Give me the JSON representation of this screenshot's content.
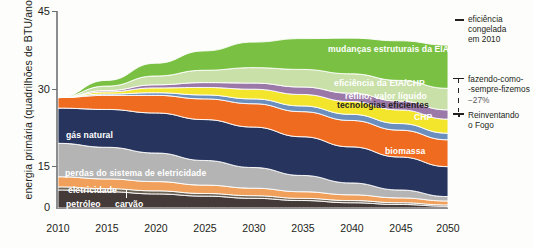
{
  "chart_data": {
    "type": "area",
    "title": "",
    "xlabel": "",
    "ylabel": "energia primária (quadrilhões de BTU/ano)",
    "x": [
      2010,
      2015,
      2020,
      2025,
      2030,
      2035,
      2040,
      2045,
      2050
    ],
    "xtick_labels": [
      "2010",
      "2015",
      "2020",
      "2025",
      "2030",
      "2035",
      "2040",
      "2045",
      "2050"
    ],
    "ytick_labels": [
      "0",
      "15",
      "30",
      "45"
    ],
    "ylim": [
      0,
      45
    ],
    "grid": false,
    "legend_position": "in-plot (band labels) and right margin",
    "stack_order_bottom_to_top": [
      "carvão",
      "petróleo",
      "eletricidade",
      "perdas do sistema de eletricidade",
      "gás natural",
      "biomassa",
      "CHP",
      "tecnologias eficientes",
      "refino, valor líquido",
      "eficiência da EIA/CHP",
      "mudanças estruturais da EIA"
    ],
    "series": [
      {
        "name": "carvão",
        "color": "#443a38",
        "values": [
          4.1,
          3.7,
          3.2,
          2.7,
          2.2,
          1.7,
          1.2,
          0.8,
          0.4
        ]
      },
      {
        "name": "petróleo",
        "color": "#6d6355",
        "values": [
          0.7,
          0.7,
          0.7,
          0.6,
          0.6,
          0.5,
          0.5,
          0.4,
          0.3
        ]
      },
      {
        "name": "eletricidade",
        "color": "#f0a05a",
        "values": [
          2.3,
          2.2,
          2.1,
          1.9,
          1.7,
          1.5,
          1.3,
          1.1,
          0.9
        ]
      },
      {
        "name": "perdas do sistema de eletricidade",
        "color": "#b4b4b4",
        "values": [
          7.6,
          7.2,
          6.5,
          5.6,
          4.7,
          3.7,
          2.7,
          1.8,
          1.0
        ]
      },
      {
        "name": "gás natural",
        "color": "#27355e",
        "values": [
          8.0,
          8.6,
          9.1,
          9.3,
          9.2,
          8.8,
          8.2,
          7.5,
          6.8
        ]
      },
      {
        "name": "biomassa",
        "color": "#ee6b1f",
        "values": [
          2.4,
          3.2,
          4.0,
          4.7,
          5.3,
          5.7,
          6.0,
          6.1,
          6.1
        ]
      },
      {
        "name": "CHP",
        "color": "#6a8fbf",
        "values": [
          0.0,
          0.3,
          0.6,
          0.9,
          1.1,
          1.3,
          1.4,
          1.5,
          1.5
        ]
      },
      {
        "name": "tecnologias eficientes",
        "color": "#f2e52c",
        "values": [
          0.0,
          0.5,
          1.1,
          1.7,
          2.2,
          2.6,
          2.9,
          3.1,
          3.2
        ]
      },
      {
        "name": "refino, valor líquido",
        "color": "#9a78a8",
        "values": [
          0.0,
          0.3,
          0.7,
          1.1,
          1.4,
          1.7,
          1.9,
          2.0,
          2.1
        ]
      },
      {
        "name": "eficiência da EIA/CHP",
        "color": "#c9e0a8",
        "values": [
          0.0,
          1.0,
          2.0,
          2.8,
          3.5,
          4.0,
          4.4,
          4.7,
          4.9
        ]
      },
      {
        "name": "mudanças estruturais da EIA",
        "color": "#7ac143",
        "values": [
          0.0,
          1.3,
          2.9,
          4.4,
          5.8,
          7.0,
          8.1,
          9.0,
          9.8
        ]
      }
    ],
    "band_labels": [
      {
        "text": "mudanças estruturais da EIA",
        "color": "#ffffff"
      },
      {
        "text": "eficiência da EIA/CHP",
        "color": "#ffffff"
      },
      {
        "text": "refino, valor líquido",
        "color": "#ffffff"
      },
      {
        "text": "tecnologias eficientes",
        "color": "#231f20"
      },
      {
        "text": "CHP",
        "color": "#ffffff"
      },
      {
        "text": "biomassa",
        "color": "#ffffff"
      },
      {
        "text": "gás natural",
        "color": "#ffffff"
      },
      {
        "text": "perdas do sistema de eletricidade",
        "color": "#ffffff"
      },
      {
        "text": "eletricidade",
        "color": "#ffffff"
      },
      {
        "text": "petróleo",
        "color": "#ffffff"
      },
      {
        "text": "carvão",
        "color": "#ffffff"
      }
    ],
    "annotations": [
      {
        "name": "eficiencia-congelada",
        "lines": [
          "eficiência",
          "congelada",
          "em 2010"
        ]
      },
      {
        "name": "fazendo-como-sempre",
        "lines": [
          "fazendo-como-",
          "-sempre-fizemos",
          "−27%"
        ]
      },
      {
        "name": "reinventando-o-fogo",
        "lines": [
          "Reinventando",
          "o Fogo"
        ]
      }
    ]
  },
  "axis": {
    "ylabel": "energia primária (quadrilhões de BTU/ano)",
    "yticks": [
      "45",
      "30",
      "15",
      "0"
    ],
    "xticks": [
      "2010",
      "2015",
      "2020",
      "2025",
      "2030",
      "2035",
      "2040",
      "2045",
      "2050"
    ]
  },
  "bands": {
    "mudancas": "mudanças estruturais da EIA",
    "eficiencia_eia_chp": "eficiência da EIA/CHP",
    "refino": "refino, valor líquido",
    "tecnologias": "tecnologias eficientes",
    "chp": "CHP",
    "biomassa": "biomassa",
    "gas_natural": "gás natural",
    "perdas": "perdas do sistema de eletricidade",
    "eletricidade": "eletricidade",
    "petroleo": "petróleo",
    "carvao": "carvão"
  },
  "right_annotations": {
    "frozen_1": "eficiência",
    "frozen_2": "congelada",
    "frozen_3": "em 2010",
    "bau_1": "fazendo-como-",
    "bau_2": "-sempre-fizemos",
    "bau_3": "−27%",
    "rmi_1": "Reinventando",
    "rmi_2": "o Fogo"
  },
  "colors": {
    "carvao": "#443a38",
    "petroleo": "#6d6355",
    "eletricidade": "#f0a05a",
    "perdas": "#b4b4b4",
    "gas_natural": "#27355e",
    "biomassa": "#ee6b1f",
    "chp": "#6a8fbf",
    "tecnologias": "#f2e52c",
    "refino": "#9a78a8",
    "eficiencia_eia_chp": "#c9e0a8",
    "mudancas": "#7ac143",
    "axis": "#8c8d8f",
    "text": "#231f20"
  }
}
